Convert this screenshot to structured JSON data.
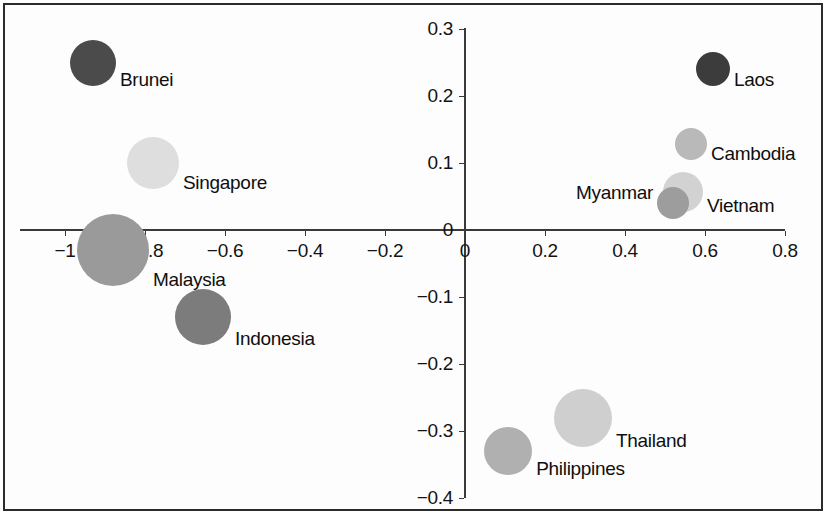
{
  "chart_data": {
    "type": "scatter",
    "title": "",
    "subtitle": "",
    "xlabel": "",
    "ylabel": "",
    "xlim": [
      -1.05,
      0.85
    ],
    "ylim": [
      -0.4,
      0.3
    ],
    "grid": false,
    "legend": "none",
    "bubble_chart": true,
    "x_ticks": [
      {
        "value": -1,
        "label": "−1"
      },
      {
        "value": -0.8,
        "label": "−0.8"
      },
      {
        "value": -0.6,
        "label": "−0.6"
      },
      {
        "value": -0.4,
        "label": "−0.4"
      },
      {
        "value": -0.2,
        "label": "−0.2"
      },
      {
        "value": 0,
        "label": "0"
      },
      {
        "value": 0.2,
        "label": "0.2"
      },
      {
        "value": 0.4,
        "label": "0.4"
      },
      {
        "value": 0.6,
        "label": "0.6"
      },
      {
        "value": 0.8,
        "label": "0.8"
      }
    ],
    "y_ticks": [
      {
        "value": 0.3,
        "label": "0.3"
      },
      {
        "value": 0.2,
        "label": "0.2"
      },
      {
        "value": 0.1,
        "label": "0.1"
      },
      {
        "value": 0,
        "label": "0"
      },
      {
        "value": -0.1,
        "label": "−0.1"
      },
      {
        "value": -0.2,
        "label": "−0.2"
      },
      {
        "value": -0.3,
        "label": "−0.3"
      },
      {
        "value": -0.4,
        "label": "−0.4"
      }
    ],
    "points": [
      {
        "name": "Brunei",
        "x": -0.93,
        "y": 0.25,
        "r": 23,
        "color": "#4b4b4b",
        "label_side": "right"
      },
      {
        "name": "Singapore",
        "x": -0.78,
        "y": 0.1,
        "r": 26,
        "color": "#dedede",
        "label_side": "right"
      },
      {
        "name": "Malaysia",
        "x": -0.88,
        "y": -0.03,
        "r": 36,
        "color": "#9a9a9a",
        "label_side": "right"
      },
      {
        "name": "Indonesia",
        "x": -0.655,
        "y": -0.13,
        "r": 28,
        "color": "#7c7c7c",
        "label_side": "right"
      },
      {
        "name": "Laos",
        "x": 0.62,
        "y": 0.24,
        "r": 17,
        "color": "#3c3c3c",
        "label_side": "right"
      },
      {
        "name": "Cambodia",
        "x": 0.565,
        "y": 0.128,
        "r": 16,
        "color": "#b9b9b9",
        "label_side": "right"
      },
      {
        "name": "Vietnam",
        "x": 0.545,
        "y": 0.057,
        "r": 20,
        "color": "#d2d2d2",
        "label_side": "right"
      },
      {
        "name": "Myanmar",
        "x": 0.52,
        "y": 0.04,
        "r": 16,
        "color": "#9d9d9d",
        "label_side": "left"
      },
      {
        "name": "Thailand",
        "x": 0.295,
        "y": -0.28,
        "r": 29,
        "color": "#cfcfcf",
        "label_side": "right"
      },
      {
        "name": "Philippines",
        "x": 0.108,
        "y": -0.33,
        "r": 24,
        "color": "#b0b0b0",
        "label_side": "right"
      }
    ]
  },
  "labels": {
    "brunei": "Brunei",
    "singapore": "Singapore",
    "malaysia": "Malaysia",
    "indonesia": "Indonesia",
    "laos": "Laos",
    "cambodia": "Cambodia",
    "vietnam": "Vietnam",
    "myanmar": "Myanmar",
    "thailand": "Thailand",
    "philippines": "Philippines"
  },
  "colors": {
    "axis": "#3a3a3a",
    "frame": "#2b2b2b",
    "text": "#131313",
    "background": "#ffffff"
  }
}
